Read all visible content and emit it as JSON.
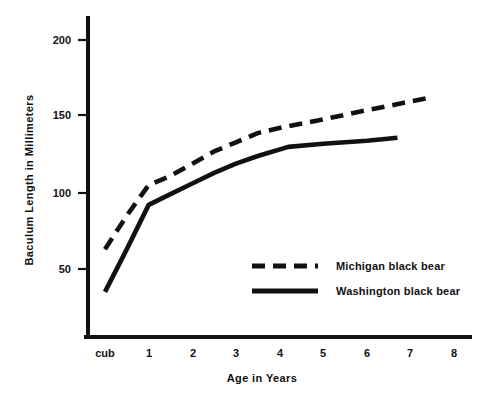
{
  "chart_data": {
    "type": "line",
    "title": "",
    "subtitle": "",
    "xlabel": "Age in Years",
    "ylabel": "Baculum Length in Millimeters",
    "grid": false,
    "legend_position": "center-right-inside",
    "xlim": [
      0,
      9
    ],
    "ylim": [
      0,
      215
    ],
    "x_tick_labels": [
      "cub",
      "1",
      "2",
      "3",
      "4",
      "5",
      "6",
      "7",
      "8"
    ],
    "x_tick_values": [
      0,
      1,
      2,
      3,
      4,
      5,
      6,
      7,
      8
    ],
    "y_tick_labels": [
      "50",
      "100",
      "150",
      "200"
    ],
    "y_tick_values": [
      50,
      100,
      150,
      200
    ],
    "series": [
      {
        "name": "Michigan black bear",
        "style": "dashed",
        "color": "#111111",
        "x": [
          0.0,
          0.5,
          1.0,
          1.5,
          2.0,
          2.5,
          3.0,
          3.5,
          4.1,
          5.0,
          6.0,
          7.4
        ],
        "values": [
          63,
          85,
          105,
          111,
          119,
          127,
          133,
          139,
          143,
          148,
          154,
          162
        ]
      },
      {
        "name": "Washington black bear",
        "style": "solid",
        "color": "#111111",
        "x": [
          0.0,
          0.5,
          1.0,
          1.5,
          2.0,
          2.5,
          3.0,
          3.5,
          4.2,
          5.0,
          6.0,
          6.7
        ],
        "values": [
          35,
          63,
          92,
          99,
          106,
          113,
          119,
          124,
          130,
          132,
          134,
          136
        ]
      }
    ]
  },
  "legend": {
    "entries": [
      {
        "label": "Michigan black bear",
        "style": "dashed"
      },
      {
        "label": "Washington black bear",
        "style": "solid"
      }
    ]
  },
  "axes": {
    "y_title": "Baculum Length in Millimeters",
    "x_title": "Age in Years",
    "y_ticks": [
      {
        "label": "200"
      },
      {
        "label": "150"
      },
      {
        "label": "100"
      },
      {
        "label": "50"
      }
    ],
    "x_ticks": [
      {
        "label": "cub"
      },
      {
        "label": "1"
      },
      {
        "label": "2"
      },
      {
        "label": "3"
      },
      {
        "label": "4"
      },
      {
        "label": "5"
      },
      {
        "label": "6"
      },
      {
        "label": "7"
      },
      {
        "label": "8"
      }
    ]
  }
}
